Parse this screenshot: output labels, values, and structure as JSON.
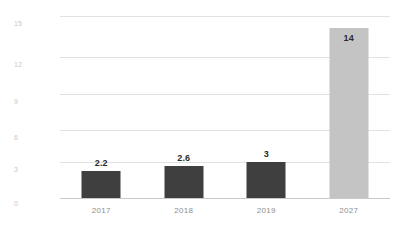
{
  "chart_data": {
    "type": "bar",
    "title": "",
    "subtitle": "",
    "xlabel": "",
    "ylabel": "",
    "categories": [
      "2017",
      "2018",
      "2019",
      "2027"
    ],
    "values": [
      2.2,
      2.6,
      3,
      14
    ],
    "value_labels": [
      "2.2",
      "2.6",
      "3",
      "14"
    ],
    "bar_colors": [
      "#3f3f3f",
      "#3f3f3f",
      "#3f3f3f",
      "#c4c4c4"
    ],
    "label_placement": [
      "above",
      "above",
      "above",
      "inside"
    ],
    "ylim": [
      0,
      15
    ],
    "yticks": [
      0,
      3,
      6,
      9,
      12,
      15
    ],
    "ytick_labels": [
      "0",
      "3",
      "6",
      "9",
      "12",
      "15"
    ],
    "grid": true,
    "legend": false,
    "legend_position": "none",
    "background_color": "#ffffff",
    "gridline_color": "#e2e2e2",
    "axis_color": "#c9c9c9",
    "tick_label_color": "#c8c8c8",
    "category_label_color": "#8e8e8e",
    "value_label_color": "#2b2b2b"
  }
}
